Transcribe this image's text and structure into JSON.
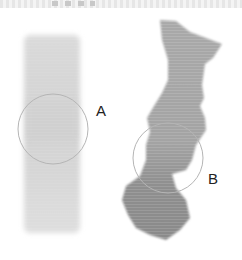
{
  "figure": {
    "panels": [
      {
        "id": "left-specimen",
        "callout_label": "A",
        "shade": "#d4d4d4"
      },
      {
        "id": "right-specimen",
        "callout_label": "B",
        "shade": "#9c9c9c"
      }
    ],
    "circle_color": "#b0b0b0"
  }
}
